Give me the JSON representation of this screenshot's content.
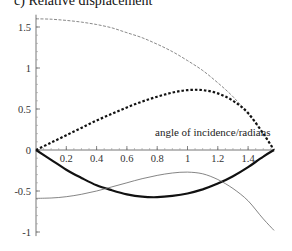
{
  "chart_data": {
    "type": "line",
    "title": "c) Relative displacement",
    "xlabel": "angle of incidence/radians",
    "ylabel": "",
    "xlim": [
      0,
      1.5708
    ],
    "ylim": [
      -1.05,
      1.65
    ],
    "x_ticks": [
      0.2,
      0.4,
      0.6,
      0.8,
      1,
      1.2,
      1.4
    ],
    "x_tick_labels": [
      "0.2",
      "0.4",
      "0.6",
      "0.8",
      "1",
      "1.2",
      "1.4"
    ],
    "y_ticks": [
      -1,
      -0.5,
      0,
      0.5,
      1,
      1.5
    ],
    "y_tick_labels": [
      "-1",
      "-0.5",
      "0",
      "0.5",
      "1",
      "1.5"
    ],
    "grid": false,
    "legend": null,
    "x": [
      0,
      0.1,
      0.2,
      0.3,
      0.4,
      0.5,
      0.6,
      0.7,
      0.8,
      0.9,
      1.0,
      1.1,
      1.2,
      1.3,
      1.4,
      1.5,
      1.5708
    ],
    "series": [
      {
        "name": "thin dashed curve",
        "style": "thin-dashed",
        "values": [
          1.6,
          1.595,
          1.58,
          1.56,
          1.53,
          1.49,
          1.43,
          1.37,
          1.29,
          1.2,
          1.09,
          0.97,
          0.82,
          0.65,
          0.44,
          0.2,
          0
        ]
      },
      {
        "name": "thick dotted curve",
        "style": "thick-dotted",
        "values": [
          0,
          0.09,
          0.18,
          0.27,
          0.36,
          0.44,
          0.52,
          0.59,
          0.65,
          0.7,
          0.73,
          0.73,
          0.69,
          0.6,
          0.45,
          0.2,
          0
        ]
      },
      {
        "name": "thick solid curve",
        "style": "thick-solid",
        "values": [
          0,
          -0.12,
          -0.24,
          -0.34,
          -0.43,
          -0.49,
          -0.54,
          -0.57,
          -0.575,
          -0.56,
          -0.53,
          -0.48,
          -0.41,
          -0.32,
          -0.21,
          -0.08,
          0
        ]
      },
      {
        "name": "thin solid curve",
        "style": "thin-solid",
        "values": [
          -0.59,
          -0.585,
          -0.57,
          -0.54,
          -0.5,
          -0.45,
          -0.4,
          -0.35,
          -0.31,
          -0.28,
          -0.27,
          -0.29,
          -0.36,
          -0.47,
          -0.62,
          -0.84,
          -0.98
        ]
      }
    ]
  }
}
